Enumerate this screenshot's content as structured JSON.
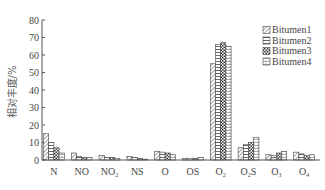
{
  "chart_data": {
    "type": "bar",
    "title": "",
    "xlabel": "",
    "ylabel": "相对丰度/%",
    "ylim": [
      0,
      80
    ],
    "yticks": [
      0,
      10,
      20,
      30,
      40,
      50,
      60,
      70,
      80
    ],
    "grid": false,
    "legend_position": "upper right",
    "categories": [
      "N",
      "NO",
      "NO2",
      "NS",
      "O",
      "OS",
      "O2",
      "O2S",
      "O3",
      "O4"
    ],
    "category_labels": [
      {
        "base": "N",
        "sub": ""
      },
      {
        "base": "NO",
        "sub": ""
      },
      {
        "base": "NO",
        "sub": "2"
      },
      {
        "base": "NS",
        "sub": ""
      },
      {
        "base": "O",
        "sub": ""
      },
      {
        "base": "OS",
        "sub": ""
      },
      {
        "base": "O",
        "sub": "2"
      },
      {
        "base": "O",
        "sub": "2",
        "suffix": "S"
      },
      {
        "base": "O",
        "sub": "3"
      },
      {
        "base": "O",
        "sub": "4"
      }
    ],
    "series": [
      {
        "name": "Bitumen1",
        "pattern": "diagonal",
        "values": [
          15,
          4,
          2.5,
          2,
          5,
          1,
          55,
          7,
          3,
          4.5
        ]
      },
      {
        "name": "Bitumen2",
        "pattern": "horizontal",
        "values": [
          10,
          2,
          1.5,
          1.5,
          4.5,
          1,
          66,
          9,
          2.5,
          3.5
        ]
      },
      {
        "name": "Bitumen3",
        "pattern": "checker",
        "values": [
          7,
          1.5,
          1.5,
          1,
          4,
          1,
          67,
          10,
          4,
          2.5
        ]
      },
      {
        "name": "Bitumen4",
        "pattern": "grid",
        "values": [
          4,
          1.5,
          1,
          0.5,
          3,
          1.5,
          65,
          13,
          5,
          3
        ]
      }
    ]
  }
}
